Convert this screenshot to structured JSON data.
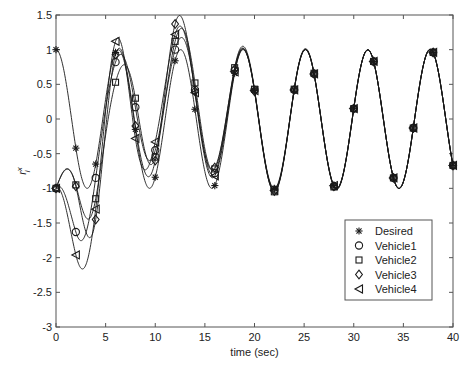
{
  "chart_data": {
    "type": "line",
    "title": "",
    "xlabel": "time (sec)",
    "ylabel": "r_i^x",
    "ylabel_base": "r",
    "ylabel_sub": "i",
    "ylabel_sup": "x",
    "xlim": [
      0,
      40
    ],
    "ylim": [
      -3,
      1.5
    ],
    "xticks": [
      0,
      5,
      10,
      15,
      20,
      25,
      30,
      35,
      40
    ],
    "yticks": [
      1.5,
      1,
      0.5,
      0,
      -0.5,
      -1,
      -1.5,
      -2,
      -2.5,
      -3
    ],
    "xtick_labels": [
      "0",
      "5",
      "10",
      "15",
      "20",
      "25",
      "30",
      "35",
      "40"
    ],
    "ytick_labels": [
      "1.5",
      "1",
      "0.5",
      "0",
      "-0.5",
      "-1",
      "-1.5",
      "-2",
      "-2.5",
      "-3"
    ],
    "grid": false,
    "legend_position": "lower right (inside)",
    "marker_times": [
      0,
      2,
      4,
      6,
      8,
      10,
      12,
      14,
      16,
      18,
      20,
      22,
      24,
      26,
      28,
      30,
      32,
      34,
      36,
      38,
      40
    ],
    "series": [
      {
        "name": "Desired",
        "marker": "asterisk",
        "function": "cos(t)",
        "values": [
          1.0,
          -0.42,
          -0.65,
          0.96,
          -0.15,
          -0.84,
          0.84,
          0.14,
          -0.96,
          0.66,
          0.41,
          -1.0,
          0.42,
          0.65,
          -0.96,
          0.15,
          0.83,
          -0.85,
          -0.13,
          0.96,
          -0.67
        ]
      },
      {
        "name": "Vehicle1",
        "marker": "circle",
        "values": [
          -1.0,
          -1.63,
          -0.85,
          0.82,
          0.17,
          -0.45,
          1.0,
          0.42,
          -0.78,
          0.7,
          0.42,
          -1.02,
          0.42,
          0.65,
          -0.97,
          0.15,
          0.83,
          -0.85,
          -0.13,
          0.96,
          -0.67
        ]
      },
      {
        "name": "Vehicle2",
        "marker": "square",
        "values": [
          -1.0,
          -0.95,
          -1.15,
          0.53,
          0.3,
          -0.55,
          1.12,
          0.52,
          -0.72,
          0.74,
          0.43,
          -1.05,
          0.43,
          0.66,
          -0.98,
          0.15,
          0.83,
          -0.85,
          -0.13,
          0.96,
          -0.67
        ]
      },
      {
        "name": "Vehicle3",
        "marker": "diamond",
        "values": [
          -1.0,
          -0.97,
          -1.45,
          0.93,
          -0.1,
          -0.6,
          1.37,
          0.4,
          -0.7,
          0.72,
          0.4,
          -1.04,
          0.42,
          0.65,
          -0.97,
          0.15,
          0.83,
          -0.85,
          -0.13,
          0.96,
          -0.67
        ]
      },
      {
        "name": "Vehicle4",
        "marker": "triangle-left",
        "values": [
          -1.0,
          -1.96,
          -1.3,
          1.12,
          -0.28,
          -0.33,
          1.22,
          0.38,
          -0.82,
          0.68,
          0.41,
          -1.03,
          0.42,
          0.65,
          -0.96,
          0.15,
          0.83,
          -0.85,
          -0.13,
          0.96,
          -0.67
        ]
      }
    ]
  },
  "legend": {
    "items": [
      {
        "label": "Desired",
        "icon": "asterisk-marker-icon"
      },
      {
        "label": "Vehicle1",
        "icon": "circle-marker-icon"
      },
      {
        "label": "Vehicle2",
        "icon": "square-marker-icon"
      },
      {
        "label": "Vehicle3",
        "icon": "diamond-marker-icon"
      },
      {
        "label": "Vehicle4",
        "icon": "triangle-left-marker-icon"
      }
    ]
  },
  "colors": {
    "line": "#1a1a1a",
    "axis": "#555555",
    "background": "#ffffff"
  }
}
